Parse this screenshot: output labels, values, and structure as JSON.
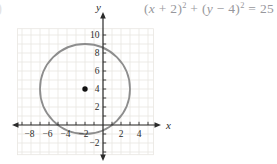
{
  "page": {
    "background": "#ffffff",
    "stray_glyph": ")"
  },
  "equation": {
    "full_text": "(x + 2)² + (y − 4)² = 25",
    "lhs1_open": "(",
    "var_x": "x",
    "lhs1_rest": " + 2)",
    "exp1": "2",
    "plus_open": " + (",
    "var_y": "y",
    "lhs2_rest": " − 4)",
    "exp2": "2",
    "rhs": " = 25",
    "color": "#97979c"
  },
  "chart_data": {
    "type": "line",
    "subtype": "circle-on-coordinate-plane",
    "title": "",
    "equation": "(x + 2)^2 + (y - 4)^2 = 25",
    "circle": {
      "center_x": -2,
      "center_y": 4,
      "radius": 5
    },
    "center_point": {
      "x": -2,
      "y": 4,
      "marked": true
    },
    "xlabel": "x",
    "ylabel": "y",
    "xlim": [
      -9.9,
      6.3
    ],
    "ylim": [
      -3.9,
      12.4
    ],
    "x_tick_values": [
      -8,
      -6,
      -4,
      -2,
      2,
      4
    ],
    "x_tick_labels": [
      "−8",
      "−6",
      "−4",
      "−2",
      "2",
      "4"
    ],
    "y_tick_values": [
      10,
      8,
      6,
      4,
      2,
      -2
    ],
    "y_tick_labels": [
      "10",
      "8",
      "6",
      "4",
      "2",
      "−2"
    ],
    "minor_tick_step": 1,
    "minor_tick_range_x": [
      -9,
      5
    ],
    "minor_tick_range_y": [
      -3,
      10
    ],
    "grid": true,
    "grid_range_x": [
      -9.5,
      5.6
    ],
    "grid_range_y": [
      -3.3,
      10.7
    ],
    "colors": {
      "circle_stroke": "#8d8d8d",
      "axis": "#2b2b2b",
      "grid_line": "#e9e6e1",
      "tick_label": "#2b2b2b",
      "center_dot": "#111111"
    }
  }
}
